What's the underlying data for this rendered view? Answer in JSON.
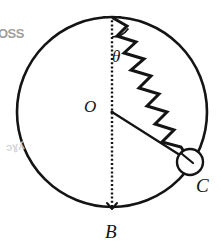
{
  "figure": {
    "type": "physics-diagram",
    "background_color": "#ffffff",
    "ink_color": "#141414",
    "labels": {
      "center": "O",
      "bottom": "B",
      "bead": "C",
      "angle": "θ"
    },
    "geometry": {
      "circle": {
        "cx": 112,
        "cy": 112,
        "r": 95,
        "stroke_width": 2.6
      },
      "top_point": {
        "x": 112,
        "y": 17
      },
      "bottom_point": {
        "x": 112,
        "y": 207
      },
      "bead": {
        "cx": 190,
        "cy": 162,
        "r": 13,
        "stroke_width": 2.4
      },
      "diameter": {
        "style": "dotted",
        "from": "top_point",
        "to": "bottom_point"
      },
      "radius_line": {
        "style": "solid",
        "from": "center",
        "to": "bead"
      },
      "spring": {
        "style": "zigzag",
        "from": "top_point",
        "to": "bead",
        "coils": 8,
        "amplitude": 11,
        "stroke_width": 3.0
      },
      "angle_arc": {
        "vertex": "top_point",
        "radius": 20,
        "between": [
          "diameter",
          "spring"
        ]
      }
    }
  },
  "artifacts": {
    "top_left_text": "OSS",
    "bottom_left_text": "ɔɣʎ"
  }
}
